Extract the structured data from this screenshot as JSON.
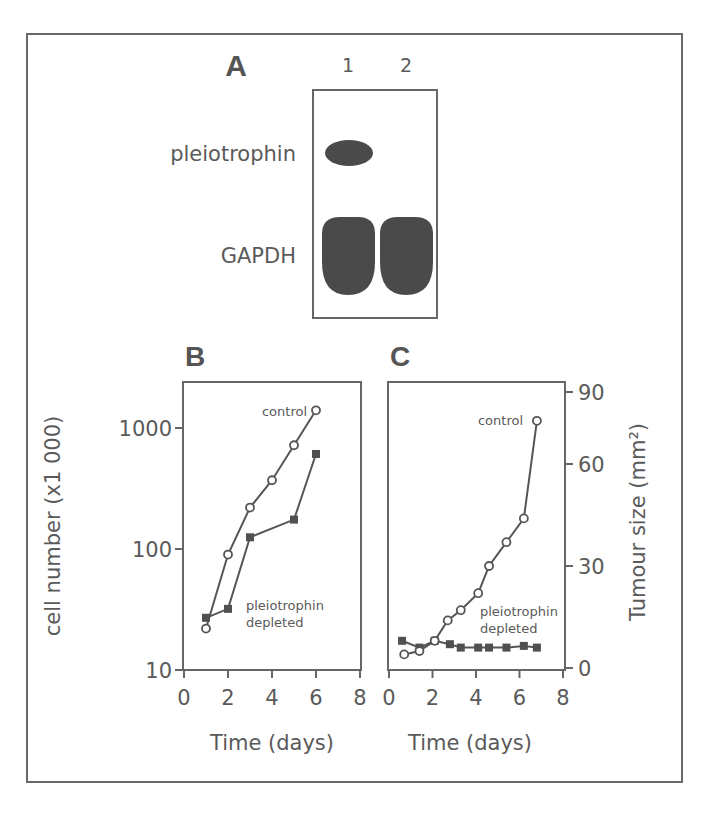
{
  "figure": {
    "panel_a": {
      "letter": "A",
      "lanes": [
        "1",
        "2"
      ],
      "rows": [
        {
          "label": "pleiotrophin",
          "lane1": "present",
          "lane2": "absent"
        },
        {
          "label": "GAPDH",
          "lane1": "present",
          "lane2": "present"
        }
      ]
    },
    "panel_b": {
      "letter": "B"
    },
    "panel_c": {
      "letter": "C"
    }
  },
  "chart_data": [
    {
      "panel": "A",
      "type": "table",
      "title": "Western/Northern blot",
      "columns": [
        "1",
        "2"
      ],
      "rows": [
        {
          "label": "pleiotrophin",
          "values": [
            "band",
            "none"
          ]
        },
        {
          "label": "GAPDH",
          "values": [
            "band",
            "band"
          ]
        }
      ]
    },
    {
      "panel": "B",
      "type": "line",
      "title": "",
      "xlabel": "Time (days)",
      "ylabel": "cell number (x1 000)",
      "yscale": "log",
      "xlim": [
        0,
        8
      ],
      "ylim": [
        10,
        2000
      ],
      "xticks": [
        0,
        2,
        4,
        6,
        8
      ],
      "yticks": [
        10,
        100,
        1000
      ],
      "ytick_labels": [
        "10",
        "100",
        "1000"
      ],
      "grid": false,
      "series": [
        {
          "name": "control",
          "marker": "open-circle",
          "x": [
            1,
            2,
            3,
            4,
            5,
            6
          ],
          "values": [
            22,
            90,
            220,
            370,
            720,
            1400
          ]
        },
        {
          "name": "pleiotrophin depleted",
          "marker": "filled-square",
          "x": [
            1,
            2,
            3,
            5,
            6
          ],
          "values": [
            27,
            32,
            125,
            175,
            610
          ]
        }
      ],
      "annotations": [
        {
          "text": "control",
          "near": "control series end"
        },
        {
          "text": "pleiotrophin",
          "line2": "depleted",
          "near": "depleted series start"
        }
      ]
    },
    {
      "panel": "C",
      "type": "line",
      "title": "",
      "xlabel": "Time (days)",
      "ylabel": "Tumour size (mm²)",
      "yaxis_side": "right",
      "xlim": [
        0,
        8
      ],
      "ylim": [
        0,
        90
      ],
      "xticks": [
        0,
        2,
        4,
        6,
        8
      ],
      "yticks": [
        0,
        30,
        60,
        90
      ],
      "grid": false,
      "series": [
        {
          "name": "control",
          "marker": "open-circle",
          "x": [
            0.7,
            1.4,
            2.1,
            2.7,
            3.3,
            4.1,
            4.6,
            5.4,
            6.2,
            6.8
          ],
          "values": [
            4,
            5,
            8,
            14,
            17,
            22,
            30,
            37,
            44,
            78
          ]
        },
        {
          "name": "pleiotrophin depleted",
          "marker": "filled-square",
          "x": [
            0.6,
            1.4,
            2.1,
            2.8,
            3.3,
            4.1,
            4.6,
            5.4,
            6.2,
            6.8
          ],
          "values": [
            8,
            6,
            8,
            7,
            6,
            6,
            6,
            6,
            6.5,
            6
          ]
        }
      ],
      "annotations": [
        {
          "text": "control",
          "near": "control series end"
        },
        {
          "text": "pleiotrophin",
          "line2": "depleted",
          "near": "depleted series"
        }
      ]
    }
  ]
}
